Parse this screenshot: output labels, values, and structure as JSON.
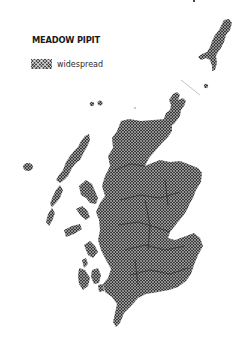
{
  "map": {
    "title": "MEADOW PIPIT",
    "legend": [
      {
        "pattern": "crosshatch",
        "label": "widespread",
        "color": "#4a4a4a"
      }
    ],
    "regions": [
      {
        "name": "mainland-scotland",
        "status": "widespread"
      },
      {
        "name": "outer-hebrides",
        "status": "widespread"
      },
      {
        "name": "inner-hebrides",
        "status": "widespread"
      },
      {
        "name": "orkney",
        "status": "widespread"
      },
      {
        "name": "shetland",
        "status": "widespread"
      },
      {
        "name": "st-kilda",
        "status": "widespread"
      },
      {
        "name": "fair-isle",
        "status": "widespread"
      }
    ],
    "colors": {
      "fill": "#4a4a4a",
      "background": "#ffffff",
      "text": "#1a1a1a"
    }
  }
}
